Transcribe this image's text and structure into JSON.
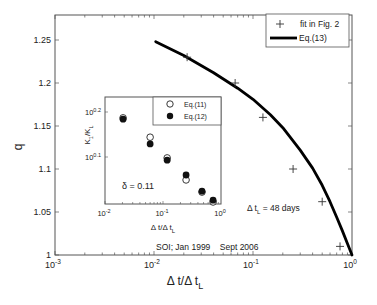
{
  "chart_data": [
    {
      "type": "line",
      "role": "main",
      "title": "",
      "xlabel": "Δ t/Δ t",
      "xlabel_sub": "L",
      "ylabel": "q",
      "xscale": "log",
      "xlim": [
        0.001,
        1
      ],
      "ylim": [
        1.0,
        1.28
      ],
      "x_ticks": [
        {
          "value": 0.001,
          "base": "10",
          "exp": "-3"
        },
        {
          "value": 0.01,
          "base": "10",
          "exp": "-2"
        },
        {
          "value": 0.1,
          "base": "10",
          "exp": "-1"
        },
        {
          "value": 1,
          "base": "10",
          "exp": "0"
        }
      ],
      "y_ticks": [
        "1",
        "1.05",
        "1.1",
        "1.15",
        "1.2",
        "1.25"
      ],
      "grid": false,
      "legend_position": "upper right",
      "series": [
        {
          "name": "fit in Fig. 2",
          "marker": "+",
          "x": [
            0.0216,
            0.066,
            0.126,
            0.254,
            0.5,
            0.757
          ],
          "y": [
            1.23,
            1.2,
            1.16,
            1.1,
            1.062,
            1.01
          ]
        },
        {
          "name": "Eq.(13)",
          "style": "thick-line",
          "x": [
            0.0104,
            0.02,
            0.04,
            0.07,
            0.1,
            0.15,
            0.2,
            0.3,
            0.4,
            0.5,
            0.6,
            0.7,
            0.8,
            0.9,
            1.0
          ],
          "y": [
            1.248,
            1.232,
            1.212,
            1.194,
            1.181,
            1.163,
            1.148,
            1.122,
            1.101,
            1.081,
            1.062,
            1.044,
            1.028,
            1.013,
            1.0
          ]
        }
      ],
      "annotations": [
        {
          "text": "Δ t",
          "sub": "L",
          "rest": " = 48 days"
        },
        {
          "text": "SOI; Jan 1999    Sept 2006"
        }
      ]
    },
    {
      "type": "scatter",
      "role": "inset",
      "xlabel": "Δ t/Δ t",
      "xlabel_sub": "L",
      "ylabel": "K",
      "ylabel_sub1": "1",
      "ylabel_mid": "/K",
      "ylabel_sub2": "L",
      "xscale": "log",
      "yscale": "log",
      "xlim": [
        0.01,
        1
      ],
      "ylim_log10": [
        0.0,
        0.215
      ],
      "x_ticks": [
        {
          "value": 0.01,
          "base": "10",
          "exp": "-2"
        },
        {
          "value": 0.1,
          "base": "10",
          "exp": "-1"
        },
        {
          "value": 1,
          "base": "10",
          "exp": "0"
        }
      ],
      "y_ticks": [
        {
          "log10": 0.1,
          "base": "10",
          "exp": "0.1"
        },
        {
          "log10": 0.2,
          "base": "10",
          "exp": "0.2"
        }
      ],
      "legend_position": "upper right",
      "series": [
        {
          "name": "Eq.(11)",
          "marker": "open-circle",
          "x": [
            0.0205,
            0.06,
            0.118,
            0.25,
            0.47,
            0.73
          ],
          "log10_y": [
            0.187,
            0.144,
            0.098,
            0.049,
            0.022,
            0.0
          ]
        },
        {
          "name": "Eq.(12)",
          "marker": "filled-circle",
          "x": [
            0.0205,
            0.06,
            0.118,
            0.25,
            0.47,
            0.73
          ],
          "log10_y": [
            0.184,
            0.129,
            0.093,
            0.06,
            0.024,
            0.004
          ]
        }
      ],
      "annotations": [
        {
          "text": "δ = 0.11"
        }
      ]
    }
  ]
}
